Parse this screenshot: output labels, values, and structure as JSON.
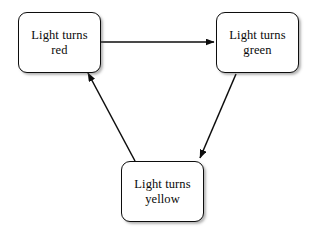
{
  "diagram": {
    "type": "state-cycle",
    "background_color": "#ffffff",
    "stroke_color": "#0d0d0d",
    "text_color": "#0a0a0a",
    "nodes": [
      {
        "id": "red",
        "label": "Light turns\nred",
        "line1": "Light turns",
        "line2": "red",
        "x": 18,
        "y": 12,
        "width": 83,
        "height": 61
      },
      {
        "id": "green",
        "label": "Light turns\ngreen",
        "line1": "Light turns",
        "line2": "green",
        "x": 216,
        "y": 12,
        "width": 83,
        "height": 61
      },
      {
        "id": "yellow",
        "label": "Light turns\nyellow",
        "line1": "Light turns",
        "line2": "yellow",
        "x": 121,
        "y": 161,
        "width": 83,
        "height": 61
      }
    ],
    "edges": [
      {
        "id": "red-to-green",
        "from": "red",
        "to": "green",
        "label": "",
        "x1": 101,
        "y1": 42,
        "x2": 214,
        "y2": 42
      },
      {
        "id": "green-to-yellow",
        "from": "green",
        "to": "yellow",
        "label": "",
        "x1": 236,
        "y1": 74,
        "x2": 199,
        "y2": 159
      },
      {
        "id": "yellow-to-red",
        "from": "yellow",
        "to": "red",
        "label": "",
        "x1": 135,
        "y1": 161,
        "x2": 88,
        "y2": 74
      }
    ]
  }
}
